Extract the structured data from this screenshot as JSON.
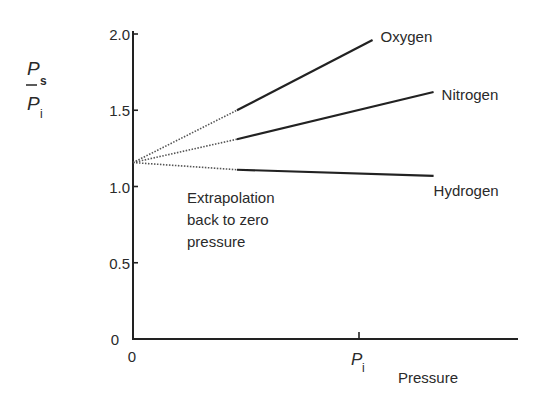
{
  "chart_data": {
    "type": "line",
    "title": "",
    "ylabel_num": "P",
    "ylabel_num_sub": "s",
    "ylabel_den": "P",
    "ylabel_den_sub": "i",
    "xlabel": "Pressure",
    "x_unit": "P_i",
    "xlim": [
      0,
      1.7
    ],
    "ylim": [
      0,
      2.0
    ],
    "yticks": [
      {
        "value": 0,
        "label": "0"
      },
      {
        "value": 0.5,
        "label": "0.5"
      },
      {
        "value": 1.0,
        "label": "1.0"
      },
      {
        "value": 1.5,
        "label": "1.5"
      },
      {
        "value": 2.0,
        "label": "2.0"
      }
    ],
    "xticks": [
      {
        "value": 0,
        "label": "0"
      },
      {
        "value": 1.0,
        "label": "P",
        "sub": "i"
      }
    ],
    "intercept": 1.157,
    "series": [
      {
        "name": "Oxygen",
        "extrapolated": [
          [
            0,
            1.157
          ],
          [
            0.46,
            1.5
          ]
        ],
        "measured": [
          [
            0.46,
            1.5
          ],
          [
            1.06,
            1.96
          ]
        ]
      },
      {
        "name": "Nitrogen",
        "extrapolated": [
          [
            0,
            1.157
          ],
          [
            0.46,
            1.31
          ]
        ],
        "measured": [
          [
            0.46,
            1.31
          ],
          [
            1.33,
            1.62
          ]
        ]
      },
      {
        "name": "Hydrogen",
        "extrapolated": [
          [
            0,
            1.157
          ],
          [
            0.46,
            1.11
          ]
        ],
        "measured": [
          [
            0.46,
            1.11
          ],
          [
            1.33,
            1.07
          ]
        ]
      }
    ],
    "annotations": [
      {
        "lines": [
          "Extrapolation",
          "back to zero",
          "pressure"
        ]
      }
    ],
    "grid": false,
    "legend": "inline labels at line ends"
  }
}
